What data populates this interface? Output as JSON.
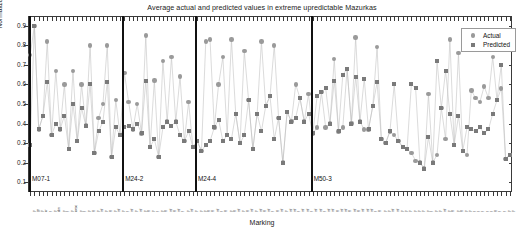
{
  "chart_data": {
    "type": "scatter",
    "title": "Average actual and predicted values in extreme upredictable Mazurkas",
    "xlabel": "Marking",
    "ylabel": "Normalized sones",
    "ylim": [
      0.05,
      0.95
    ],
    "yticks": [
      0.1,
      0.2,
      0.3,
      0.4,
      0.5,
      0.6,
      0.7,
      0.8,
      0.9
    ],
    "ytick_labels": [
      "0.1",
      "0.2",
      "0.3",
      "0.4",
      "0.5",
      "0.6",
      "0.7",
      "0.8",
      "0.9"
    ],
    "grid": false,
    "legend_position": "top-right",
    "legend": [
      "Actual",
      "Predicted"
    ],
    "series": [
      {
        "name": "Actual",
        "marker": "circle",
        "color": "#9a9a9a",
        "values": [
          0.75,
          0.9,
          0.37,
          0.44,
          0.82,
          0.34,
          0.67,
          0.37,
          0.6,
          0.27,
          0.67,
          0.31,
          0.6,
          0.39,
          0.8,
          0.25,
          0.43,
          0.5,
          0.8,
          0.23,
          0.52,
          0.34,
          0.66,
          0.51,
          0.37,
          0.5,
          0.35,
          0.85,
          0.28,
          0.62,
          0.23,
          0.72,
          0.41,
          0.74,
          0.41,
          0.64,
          0.31,
          0.51,
          0.28,
          0.31,
          0.26,
          0.82,
          0.83,
          0.38,
          0.6,
          0.74,
          0.34,
          0.83,
          0.45,
          0.3,
          0.77,
          0.52,
          0.27,
          0.45,
          0.82,
          0.49,
          0.54,
          0.8,
          0.43,
          0.2,
          0.46,
          0.41,
          0.6,
          0.53,
          0.41,
          0.55,
          0.35,
          0.38,
          0.56,
          0.38,
          0.4,
          0.73,
          0.36,
          0.38,
          0.68,
          0.4,
          0.84,
          0.41,
          0.37,
          0.37,
          0.49,
          0.79,
          0.32,
          0.3,
          0.36,
          0.34,
          0.31,
          0.28,
          0.27,
          0.25,
          0.21,
          0.2,
          0.17,
          0.55,
          0.2,
          0.24,
          0.48,
          0.32,
          0.83,
          0.29,
          0.76,
          0.26,
          0.24,
          0.57,
          0.53,
          0.51,
          0.59,
          0.53,
          0.74,
          0.52,
          0.58,
          0.22,
          0.24
        ]
      },
      {
        "name": "Predicted",
        "marker": "square",
        "color": "#7a7a7a",
        "values": [
          0.29,
          0.9,
          0.37,
          0.44,
          0.61,
          0.34,
          0.4,
          0.37,
          0.44,
          0.27,
          0.5,
          0.31,
          0.48,
          0.39,
          0.6,
          0.25,
          0.36,
          0.41,
          0.61,
          0.23,
          0.38,
          0.34,
          0.38,
          0.39,
          0.37,
          0.4,
          0.35,
          0.62,
          0.28,
          0.32,
          0.23,
          0.38,
          0.41,
          0.39,
          0.41,
          0.34,
          0.31,
          0.36,
          0.28,
          0.31,
          0.26,
          0.29,
          0.31,
          0.38,
          0.42,
          0.31,
          0.34,
          0.32,
          0.45,
          0.3,
          0.34,
          0.52,
          0.27,
          0.45,
          0.36,
          0.49,
          0.54,
          0.32,
          0.43,
          0.2,
          0.46,
          0.41,
          0.43,
          0.53,
          0.41,
          0.45,
          0.35,
          0.54,
          0.56,
          0.58,
          0.4,
          0.62,
          0.36,
          0.65,
          0.68,
          0.4,
          0.64,
          0.41,
          0.63,
          0.37,
          0.49,
          0.61,
          0.32,
          0.3,
          0.36,
          0.6,
          0.31,
          0.28,
          0.27,
          0.6,
          0.58,
          0.2,
          0.17,
          0.33,
          0.2,
          0.72,
          0.48,
          0.67,
          0.45,
          0.29,
          0.44,
          0.26,
          0.38,
          0.37,
          0.36,
          0.38,
          0.35,
          0.37,
          0.45,
          0.52,
          0.7,
          0.22,
          0.24
        ]
      }
    ],
    "groups": [
      {
        "label": "M07-1",
        "start": 0,
        "count": 22
      },
      {
        "label": "M24-2",
        "start": 22,
        "count": 17
      },
      {
        "label": "M24-4",
        "start": 39,
        "count": 27
      },
      {
        "label": "M50-3",
        "start": 66,
        "count": 45
      }
    ],
    "xtick_labels": [
      "p",
      "pp",
      "p",
      "cr",
      "f",
      "p",
      "dim",
      "p",
      "f",
      "p",
      "cresc",
      "p",
      "f",
      "p",
      "ff",
      "p",
      "mf",
      "p",
      "ff",
      "p",
      "mf",
      "p",
      "f",
      "mf",
      "p",
      "mf",
      "p",
      "ff",
      "p",
      "f",
      "p",
      "ff",
      "mf",
      "ff",
      "mf",
      "f",
      "p",
      "mf",
      "p",
      "p",
      "p",
      "ff",
      "ff",
      "mf",
      "f",
      "ff",
      "p",
      "ff",
      "mf",
      "p",
      "ff",
      "mf",
      "p",
      "mf",
      "ff",
      "mf",
      "f",
      "ff",
      "mf",
      "p",
      "mf",
      "mf",
      "f",
      "mf",
      "mf",
      "f",
      "mf",
      "mf",
      "f",
      "mf",
      "mf",
      "ff",
      "mf",
      "mf",
      "ff",
      "mf",
      "ff",
      "mf",
      "mf",
      "mf",
      "f",
      "ff",
      "p",
      "p",
      "mf",
      "mf",
      "p",
      "p",
      "p",
      "p",
      "p",
      "p",
      "p",
      "f",
      "p",
      "p",
      "mf",
      "p",
      "ff",
      "p",
      "ff",
      "p",
      "p",
      "f",
      "f",
      "f",
      "f",
      "f",
      "ff",
      "f",
      "f",
      "p",
      "p"
    ]
  }
}
